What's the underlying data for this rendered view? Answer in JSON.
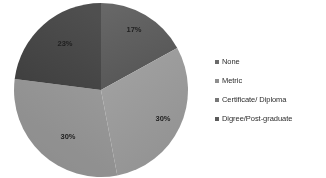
{
  "chart_data": {
    "type": "pie",
    "title": "",
    "categories": [
      "None",
      "Metric",
      "Certificate/ Diploma",
      "Digree/Post-graduate"
    ],
    "values": [
      17,
      30,
      30,
      23
    ],
    "labels": [
      "17%",
      "30%",
      "30%",
      "23%"
    ],
    "colors": [
      "#5e5e5e",
      "#9b9b9b",
      "#939393",
      "#454545"
    ],
    "legend_position": "right",
    "grid": false,
    "units": "percent",
    "start_angle_deg": 0,
    "direction": "clockwise",
    "slices": [
      {
        "name": "None",
        "value": 17,
        "label": "17%",
        "color": "#5e5e5e",
        "label_x": 121,
        "label_y": 30
      },
      {
        "name": "Metric",
        "value": 30,
        "label": "30%",
        "color": "#9b9b9b",
        "label_x": 150,
        "label_y": 119
      },
      {
        "name": "Certificate/ Diploma",
        "value": 30,
        "label": "30%",
        "color": "#939393",
        "label_x": 55,
        "label_y": 137
      },
      {
        "name": "Digree/Post-graduate",
        "value": 23,
        "label": "23%",
        "color": "#454545",
        "label_x": 52,
        "label_y": 44
      }
    ]
  },
  "legend": {
    "items": [
      {
        "label": "None",
        "marker": "legend-swatch-square",
        "color": "#6a6a6a"
      },
      {
        "label": "Metric",
        "marker": "legend-swatch-square",
        "color": "#8e8e8e"
      },
      {
        "label": "Certificate/ Diploma",
        "marker": "legend-swatch-square",
        "color": "#777777"
      },
      {
        "label": "Digree/Post-graduate",
        "marker": "legend-swatch-square",
        "color": "#5a5a5a"
      }
    ]
  },
  "canvas": {
    "background": "#ffffff",
    "width": 326,
    "height": 178
  }
}
